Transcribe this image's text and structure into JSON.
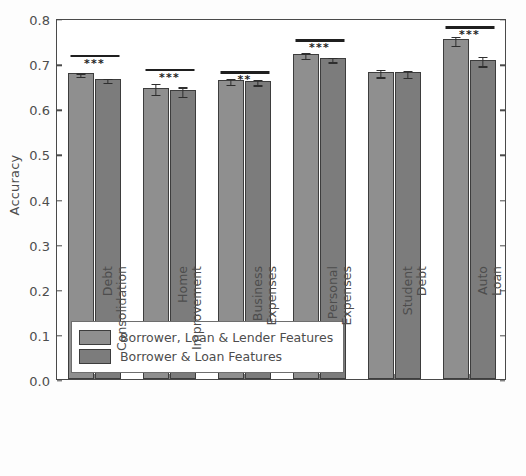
{
  "chart_data": {
    "type": "bar",
    "title": "",
    "xlabel": "",
    "ylabel": "Accuracy",
    "ylim": [
      0.0,
      0.8
    ],
    "yticks": [
      "0.0",
      "0.1",
      "0.2",
      "0.3",
      "0.4",
      "0.5",
      "0.6",
      "0.7",
      "0.8"
    ],
    "ytick_values": [
      0.0,
      0.1,
      0.2,
      0.3,
      0.4,
      0.5,
      0.6,
      0.7,
      0.8
    ],
    "grid": false,
    "legend_position": "lower left (inside axes)",
    "categories": [
      "Debt Consolidation",
      "Home Improvement",
      "Business Expenses",
      "Personal Expenses",
      "Student Debt",
      "Auto Loan"
    ],
    "category_lines": [
      [
        "Debt",
        "Consolidation"
      ],
      [
        "Home",
        "Improvement"
      ],
      [
        "Business",
        "Expenses"
      ],
      [
        "Personal",
        "Expenses"
      ],
      [
        "Student",
        "Debt"
      ],
      [
        "Auto",
        "Loan"
      ]
    ],
    "series": [
      {
        "name": "Borrower, Loan & Lender Features",
        "color": "#8f8f8f",
        "values": [
          0.678,
          0.646,
          0.663,
          0.72,
          0.681,
          0.753
        ],
        "errors": [
          0.004,
          0.012,
          0.006,
          0.006,
          0.008,
          0.01
        ]
      },
      {
        "name": "Borrower & Loan Features",
        "color": "#7c7c7c",
        "values": [
          0.665,
          0.64,
          0.661,
          0.711,
          0.68,
          0.708
        ],
        "errors": [
          0.004,
          0.011,
          0.006,
          0.005,
          0.008,
          0.011
        ]
      }
    ],
    "significance": [
      "***",
      "***",
      "**",
      "***",
      "",
      "***"
    ],
    "significance_heights": [
      0.722,
      0.692,
      0.686,
      0.757,
      null,
      0.786
    ]
  },
  "legend": {
    "entries": [
      "Borrower, Loan & Lender Features",
      "Borrower & Loan Features"
    ]
  }
}
